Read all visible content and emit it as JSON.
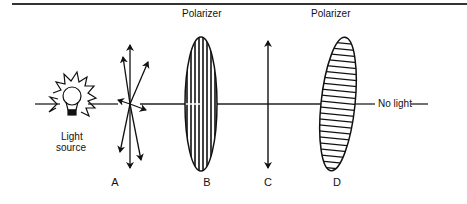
{
  "diagram": {
    "labels": {
      "polarizer_b": "Polarizer",
      "polarizer_d": "Polarizer",
      "light_source": [
        "Light",
        "source"
      ],
      "no_light": "No light"
    },
    "stages": [
      {
        "letter": "A",
        "description": "unpolarized light, vibrations in all directions"
      },
      {
        "letter": "B",
        "description": "polarizer with vertical transmission axis"
      },
      {
        "letter": "C",
        "description": "vertically polarized light"
      },
      {
        "letter": "D",
        "description": "polarizer with horizontal transmission axis"
      }
    ],
    "colors": {
      "ink": "#111111",
      "background": "#ffffff"
    }
  }
}
